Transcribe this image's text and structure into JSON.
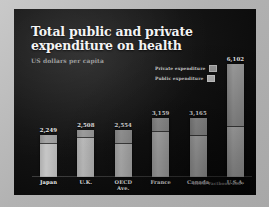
{
  "slide": {
    "title": "Total public and private expenditure on health",
    "subtitle": "US dollars per capita",
    "source": "OECD Factbook 2007"
  },
  "legend": {
    "items": [
      {
        "label": "Private expenditure",
        "color": "#9e9e9e",
        "swatch_name": "private-expenditure-swatch"
      },
      {
        "label": "Public expenditure",
        "color": "#bdbdbd",
        "swatch_name": "public-expenditure-swatch"
      }
    ]
  },
  "chart_data": {
    "type": "bar",
    "stacked": true,
    "title": "Total public and private expenditure on health",
    "subtitle": "US dollars per capita",
    "xlabel": "",
    "ylabel": "US dollars per capita",
    "ylim": [
      0,
      6400
    ],
    "grid": false,
    "legend_position": "upper-right-inside",
    "source": "OECD Factbook 2007",
    "categories": [
      "Japan",
      "U.K.",
      "OECD Ave.",
      "France",
      "Canada",
      "U.S.A."
    ],
    "total_labels": [
      "2,249",
      "2,508",
      "2,554",
      "3,159",
      "3,165",
      "6,102"
    ],
    "totals": [
      2249,
      2508,
      2554,
      3159,
      3165,
      6102
    ],
    "series": [
      {
        "name": "Public expenditure",
        "values": [
          1805,
          2127,
          1840,
          2436,
          2230,
          2724
        ]
      },
      {
        "name": "Private expenditure",
        "values": [
          444,
          381,
          714,
          723,
          935,
          3378
        ]
      }
    ]
  }
}
